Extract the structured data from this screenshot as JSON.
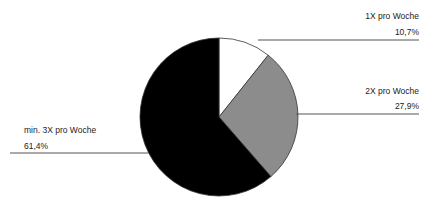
{
  "chart_data": {
    "type": "pie",
    "title": "",
    "categories": [
      "1X pro Woche",
      "2X pro Woche",
      "min. 3X pro Woche"
    ],
    "values": [
      10.7,
      27.9,
      61.4
    ],
    "value_labels": [
      "10,7%",
      "27,9%",
      "61,4%"
    ],
    "colors": [
      "#ffffff",
      "#8c8c8c",
      "#000000"
    ],
    "start_angle": "12 o'clock, clockwise",
    "legend": "none (leader-line labels)"
  },
  "labels": {
    "s0": {
      "name": "1X pro Woche",
      "pct": "10,7%"
    },
    "s1": {
      "name": "2X pro Woche",
      "pct": "27,9%"
    },
    "s2": {
      "name": "min. 3X pro Woche",
      "pct": "61,4%"
    }
  }
}
